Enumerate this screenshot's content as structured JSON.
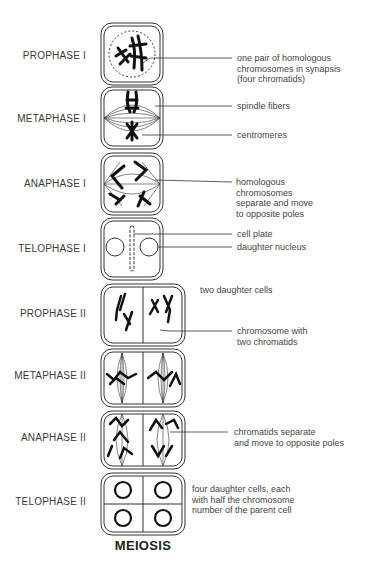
{
  "title": "MEIOSIS",
  "stages": [
    {
      "name": "PROPHASE I",
      "top": 50
    },
    {
      "name": "METAPHASE I",
      "top": 113
    },
    {
      "name": "ANAPHASE I",
      "top": 178
    },
    {
      "name": "TELOPHASE I",
      "top": 243
    },
    {
      "name": "PROPHASE II",
      "top": 308
    },
    {
      "name": "METAPHASE II",
      "top": 370
    },
    {
      "name": "ANAPHASE II",
      "top": 432
    },
    {
      "name": "TELOPHASE II",
      "top": 496
    }
  ],
  "annotations": {
    "synapsis": [
      "one pair of homologous",
      "chromosomes in synapsis",
      "(four chromatids)"
    ],
    "spindle": "spindle fibers",
    "centromeres": "centromeres",
    "homologous_separate": [
      "homologous",
      "chromosomes",
      "separate and move",
      "to opposite poles"
    ],
    "cell_plate": "cell plate",
    "daughter_nucleus": "daughter nucleus",
    "two_daughter_cells": "two daughter cells",
    "chromosome_two_chromatids": [
      "chromosome with",
      "two chromatids"
    ],
    "chromatids_separate": [
      "chromatids separate",
      "and move to opposite poles"
    ],
    "four_daughter_cells": [
      "four daughter cells, each",
      "with half the chromosome",
      "number of the parent cell"
    ]
  },
  "colors": {
    "line": "#333333",
    "text": "#3a3a3a"
  }
}
